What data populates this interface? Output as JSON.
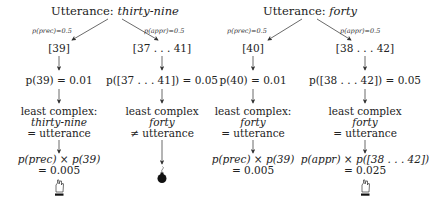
{
  "trees": [
    {
      "title_prefix": "Utterance: ",
      "utterance": "thirty-nine",
      "branches": [
        {
          "edge_label": "p(prec)=0.5",
          "interpretation": "[39]",
          "prior": "p(39) = 0.01",
          "complexity_line1": "least complex:",
          "complexity_word": "thirty-nine",
          "complexity_line3": "= utterance",
          "result_line1": "p(prec) × p(39)",
          "result_line2": "= 0.005",
          "outcome_icon": "winner-hand-icon"
        },
        {
          "edge_label": "p(appr)=0.5",
          "interpretation": "[37 . . . 41]",
          "prior": "p([37 . . . 41]) = 0.05",
          "complexity_line1": "least complex",
          "complexity_word": "forty",
          "complexity_line3": "≠ utterance",
          "outcome_icon": "bomb-icon"
        }
      ]
    },
    {
      "title_prefix": "Utterance: ",
      "utterance": "forty",
      "branches": [
        {
          "edge_label": "p(prec)=0.5",
          "interpretation": "[40]",
          "prior": "p(40) = 0.01",
          "complexity_line1": "least complex:",
          "complexity_word": "forty",
          "complexity_line3": "= utterance",
          "result_line1": "p(prec) × p(39)",
          "result_line2": "= 0.005",
          "outcome_icon": "none"
        },
        {
          "edge_label": "p(appr)=0.5",
          "interpretation": "[38 . . . 42]",
          "prior": "p([38 . . . 42]) = 0.05",
          "complexity_line1": "least complex",
          "complexity_word": "forty",
          "complexity_line3": "= utterance",
          "result_line1": "p(appr) × p([38 . . . 42])",
          "result_line2": "= 0.025",
          "outcome_icon": "winner-hand-icon"
        }
      ]
    }
  ]
}
